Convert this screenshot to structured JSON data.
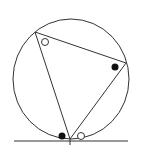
{
  "diagram": {
    "type": "geometry",
    "stroke_color": "#333333",
    "background": "#ffffff",
    "circle": {
      "cx": 71,
      "cy": 79,
      "rx": 58,
      "ry": 60
    },
    "triangle": {
      "vertices": [
        {
          "name": "top-left",
          "x": 35,
          "y": 32
        },
        {
          "name": "right",
          "x": 126,
          "y": 63
        },
        {
          "name": "bottom",
          "x": 70,
          "y": 139
        }
      ]
    },
    "tangent_line": {
      "x1": 14,
      "y1": 141,
      "x2": 128,
      "y2": 141
    },
    "markers": [
      {
        "name": "open-angle-marker-top",
        "type": "open",
        "x": 45,
        "y": 42
      },
      {
        "name": "filled-angle-marker-right",
        "type": "filled",
        "x": 115,
        "y": 67
      },
      {
        "name": "filled-angle-marker-bottom-left",
        "type": "filled",
        "x": 62,
        "y": 136
      },
      {
        "name": "open-angle-marker-bottom-right",
        "type": "open",
        "x": 81,
        "y": 136
      }
    ]
  }
}
